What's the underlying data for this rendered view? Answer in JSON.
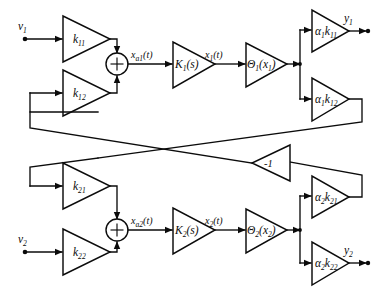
{
  "diagram": {
    "canvas": {
      "width": 373,
      "height": 296
    },
    "colors": {
      "line": "#0b0b0b",
      "background": "#ffffff",
      "fill": "#ffffff"
    }
  },
  "inputs": [
    {
      "id": "v1",
      "label": "v",
      "subscript": "1",
      "x": 14,
      "y": 34
    },
    {
      "id": "v2",
      "label": "v",
      "subscript": "2",
      "x": 14,
      "y": 245
    }
  ],
  "outputs": [
    {
      "id": "y1",
      "label": "y",
      "subscript": "1",
      "x": 347,
      "y": 26
    },
    {
      "id": "y2",
      "label": "y",
      "subscript": "2",
      "x": 347,
      "y": 258
    }
  ],
  "gain_blocks": [
    {
      "id": "k11",
      "base": "k",
      "subscript": "11",
      "channel": 1,
      "role": "input-gain"
    },
    {
      "id": "k12",
      "base": "k",
      "subscript": "12",
      "channel": 1,
      "role": "cross-feedback-gain"
    },
    {
      "id": "k21",
      "base": "k",
      "subscript": "21",
      "channel": 2,
      "role": "cross-feedback-gain"
    },
    {
      "id": "k22",
      "base": "k",
      "subscript": "22",
      "channel": 2,
      "role": "input-gain"
    },
    {
      "id": "a1k11",
      "base": "α",
      "base_sub": "1",
      "mid": "k",
      "subscript": "11",
      "channel": 1,
      "role": "output-gain"
    },
    {
      "id": "a1k12",
      "base": "α",
      "base_sub": "1",
      "mid": "k",
      "subscript": "12",
      "channel": 1,
      "role": "feedback-output-gain"
    },
    {
      "id": "a2k21",
      "base": "α",
      "base_sub": "2",
      "mid": "k",
      "subscript": "21",
      "channel": 2,
      "role": "feedback-output-gain"
    },
    {
      "id": "a2k22",
      "base": "α",
      "base_sub": "2",
      "mid": "k",
      "subscript": "22",
      "channel": 2,
      "role": "output-gain"
    }
  ],
  "transfer_blocks": [
    {
      "id": "K1s",
      "base": "K",
      "subscript": "1",
      "arg": "(s)",
      "channel": 1
    },
    {
      "id": "K2s",
      "base": "K",
      "subscript": "2",
      "arg": "(s)",
      "channel": 2
    },
    {
      "id": "Theta1",
      "base": "Θ",
      "subscript": "1",
      "arg": "(x",
      "arg_sub": "1",
      "arg_end": ")",
      "channel": 1
    },
    {
      "id": "Theta2",
      "base": "Θ",
      "subscript": "2",
      "arg": "(x",
      "arg_sub": "2",
      "arg_end": ")",
      "channel": 2
    }
  ],
  "inverter": {
    "id": "inv",
    "label": "-1"
  },
  "summers": [
    {
      "id": "sum1",
      "symbol": "+",
      "channel": 1,
      "cx": 117,
      "cy": 64
    },
    {
      "id": "sum2",
      "symbol": "+",
      "channel": 2,
      "cx": 117,
      "cy": 230
    }
  ],
  "signal_labels": [
    {
      "id": "xa1",
      "base": "x",
      "subscript": "a1",
      "arg": "(t)",
      "x": 131,
      "y": 58,
      "channel": 1
    },
    {
      "id": "x1t",
      "base": "x",
      "subscript": "1",
      "arg": "(t)",
      "x": 205,
      "y": 58,
      "channel": 1
    },
    {
      "id": "xa2",
      "base": "x",
      "subscript": "a2",
      "arg": "(t)",
      "x": 131,
      "y": 224,
      "channel": 2
    },
    {
      "id": "x2t",
      "base": "x",
      "subscript": "2",
      "arg": "(t)",
      "x": 205,
      "y": 224,
      "channel": 2
    }
  ]
}
